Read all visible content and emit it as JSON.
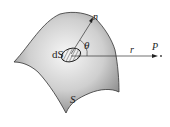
{
  "diagram": {
    "labels": {
      "surface": "S",
      "area_element": "dS",
      "normal": "n",
      "angle": "θ",
      "vector": "r",
      "point": "P"
    },
    "colors": {
      "surface_light": "#f4f4f4",
      "surface_dark": "#8a8a8a",
      "line": "#333333"
    }
  }
}
